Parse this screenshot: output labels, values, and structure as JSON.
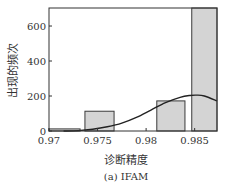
{
  "chart_data": {
    "type": "bar",
    "title": "",
    "caption": "(a) IFAM",
    "xlabel": "诊断精度",
    "ylabel": "出现的频次",
    "xlim": [
      0.97,
      0.9873
    ],
    "ylim": [
      0,
      703
    ],
    "xticks": [
      0.97,
      0.975,
      0.98,
      0.985
    ],
    "xtick_labels": [
      "0.97",
      "0.975",
      "0.98",
      "0.985"
    ],
    "yticks": [
      0,
      200,
      400,
      600
    ],
    "ytick_labels": [
      "0",
      "200",
      "400",
      "600"
    ],
    "grid": false,
    "legend": null,
    "bars": [
      {
        "x0": 0.97,
        "x1": 0.9732,
        "value": 12
      },
      {
        "x0": 0.9737,
        "x1": 0.9767,
        "value": 113
      },
      {
        "x0": 0.9811,
        "x1": 0.984,
        "value": 172
      },
      {
        "x0": 0.9847,
        "x1": 0.9876,
        "value": 703
      }
    ],
    "fit_curve": {
      "type": "line",
      "name": "normal fit",
      "x": [
        0.9715,
        0.973,
        0.9745,
        0.976,
        0.9775,
        0.979,
        0.9805,
        0.982,
        0.9835,
        0.9845,
        0.9852,
        0.986,
        0.9873
      ],
      "y": [
        0,
        2,
        10,
        24,
        45,
        78,
        120,
        162,
        192,
        203,
        205,
        200,
        172
      ]
    },
    "colors": {
      "bar_fill": "#d4d4d4",
      "bar_edge": "#3a3a3a",
      "curve": "#222222",
      "axis": "#333333"
    }
  },
  "labels": {
    "xlabel": "诊断精度",
    "ylabel": "出现的频次",
    "caption": "(a) IFAM"
  }
}
